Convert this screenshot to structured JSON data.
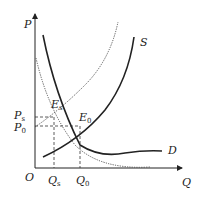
{
  "diagram": {
    "axes": {
      "y_label": "P",
      "x_label": "Q",
      "origin_label": "O"
    },
    "curves": [
      {
        "name": "S",
        "label": "S",
        "style": "solid",
        "description": "supply curve"
      },
      {
        "name": "D",
        "label": "D",
        "style": "solid",
        "description": "demand curve"
      },
      {
        "name": "dotted-upward",
        "label": "",
        "style": "dotted",
        "description": "upward dotted curve through E_s"
      },
      {
        "name": "dotted-downward",
        "label": "",
        "style": "dotted",
        "description": "downward dotted curve"
      }
    ],
    "points": [
      {
        "label": "E",
        "sub": "s"
      },
      {
        "label": "E",
        "sub": "0"
      }
    ],
    "price_ticks": [
      {
        "label": "P",
        "sub": "s"
      },
      {
        "label": "P",
        "sub": "0"
      }
    ],
    "quantity_ticks": [
      {
        "label": "Q",
        "sub": "s"
      },
      {
        "label": "Q",
        "sub": "0"
      }
    ],
    "colors": {
      "ink": "#222222",
      "dotted": "#555555"
    }
  }
}
